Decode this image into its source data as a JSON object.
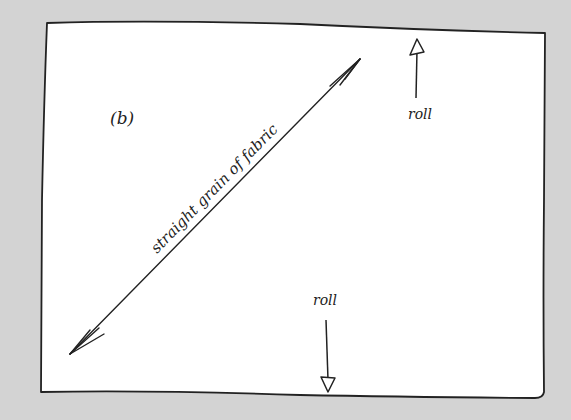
{
  "figure": {
    "panel_label": "(b)",
    "grain_label": "straight grain of fabric",
    "roll_top_label": "roll",
    "roll_bottom_label": "roll"
  },
  "colors": {
    "background": "#d3d3d3",
    "paper": "#ffffff",
    "ink": "#222222"
  }
}
